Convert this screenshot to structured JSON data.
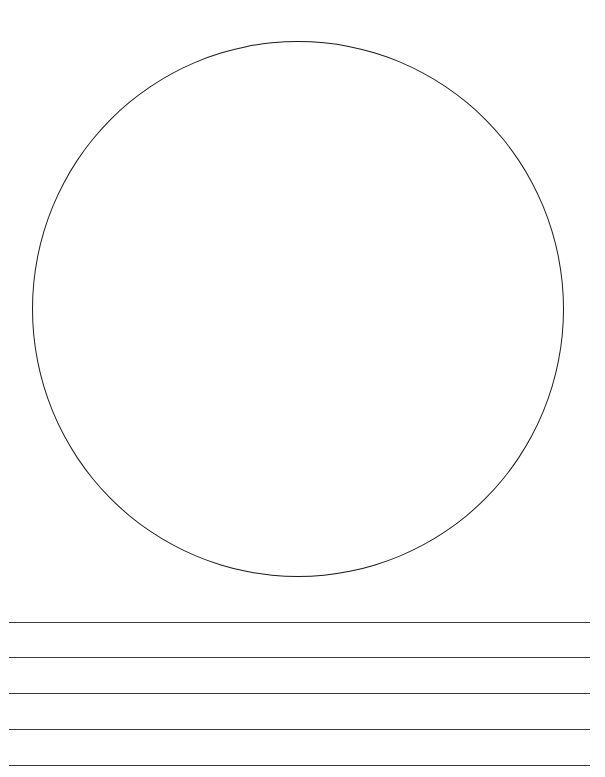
{
  "worksheet": {
    "type": "draw-and-write",
    "title": "",
    "drawing_area": {
      "shape": "circle"
    },
    "writing_lines": {
      "count": 5
    }
  }
}
